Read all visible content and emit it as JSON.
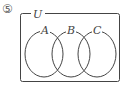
{
  "diagram": {
    "problem_number": "⑤",
    "universe_label": "U",
    "sets": [
      {
        "label": "A"
      },
      {
        "label": "B"
      },
      {
        "label": "C"
      }
    ],
    "stroke_color": "#444444"
  }
}
